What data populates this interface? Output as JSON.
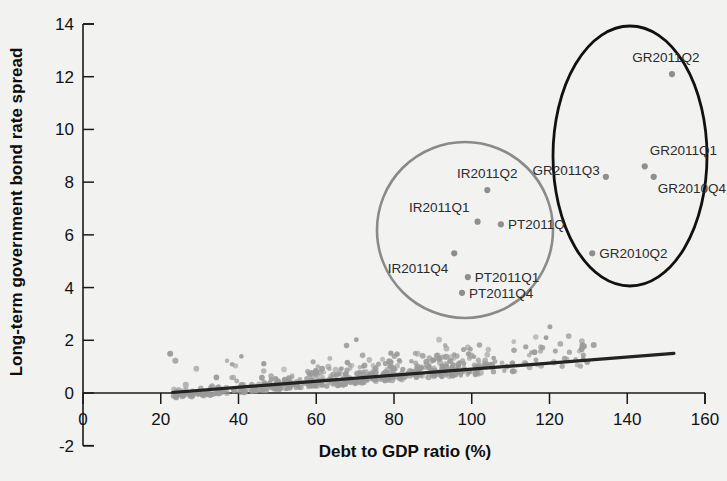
{
  "chart_data": {
    "type": "scatter",
    "title": "",
    "xlabel": "Debt to GDP ratio (%)",
    "ylabel": "Long-term government bond rate spread",
    "xlim": [
      0,
      160
    ],
    "ylim": [
      -2,
      14
    ],
    "xticks": [
      0,
      20,
      40,
      60,
      80,
      100,
      120,
      140,
      160
    ],
    "yticks": [
      -2,
      0,
      2,
      4,
      6,
      8,
      10,
      12,
      14
    ],
    "grid": false,
    "legend": "none",
    "marker_color": "#9a9a9a",
    "trendline_color": "#232323",
    "highlight_circle_left_color": "#8a8a8a",
    "highlight_circle_right_color": "#111111",
    "background_color": "#f2f2f0",
    "trendline": {
      "x_start": 23,
      "y_start": 0.02,
      "x_end": 152,
      "y_end": 1.5,
      "slope": 0.0115,
      "intercept": -0.245
    },
    "labeled_points": [
      {
        "label": "IR2011Q2",
        "x": 104.0,
        "y": 7.7,
        "label_dx": 0,
        "label_dy": -12,
        "anchor": "middle"
      },
      {
        "label": "IR2011Q1",
        "x": 101.5,
        "y": 6.5,
        "label_dx": -8,
        "label_dy": -10,
        "anchor": "end"
      },
      {
        "label": "PT2011Q",
        "x": 107.5,
        "y": 6.4,
        "label_dx": 7,
        "label_dy": 5,
        "anchor": "start"
      },
      {
        "label": "IR2011Q4",
        "x": 95.5,
        "y": 5.3,
        "label_dx": -6,
        "label_dy": 20,
        "anchor": "end"
      },
      {
        "label": "PT2011Q1",
        "x": 99.0,
        "y": 4.4,
        "label_dx": 7,
        "label_dy": 5,
        "anchor": "start"
      },
      {
        "label": "PT2011Q4",
        "x": 97.5,
        "y": 3.8,
        "label_dx": 7,
        "label_dy": 5,
        "anchor": "start"
      },
      {
        "label": "GR2011Q2",
        "x": 151.5,
        "y": 12.1,
        "label_dx": -6,
        "label_dy": -12,
        "anchor": "middle"
      },
      {
        "label": "GR2011Q1",
        "x": 144.5,
        "y": 8.6,
        "label_dx": 5,
        "label_dy": -11,
        "anchor": "start"
      },
      {
        "label": "GR2011Q3",
        "x": 134.5,
        "y": 8.2,
        "label_dx": -6,
        "label_dy": -2,
        "anchor": "end"
      },
      {
        "label": "GR2010Q4",
        "x": 146.8,
        "y": 8.2,
        "label_dx": 4,
        "label_dy": 16,
        "anchor": "start"
      },
      {
        "label": "GR2010Q2",
        "x": 131.0,
        "y": 5.3,
        "label_dx": 7,
        "label_dy": 5,
        "anchor": "start"
      }
    ],
    "highlight_regions": [
      {
        "name": "ireland-portugal-cluster",
        "shape": "circle",
        "cx_px": 465,
        "cy_px": 230,
        "rx_px": 88,
        "ry_px": 88,
        "color": "#8a8a8a"
      },
      {
        "name": "greece-cluster",
        "shape": "ellipse",
        "cx_px": 630,
        "cy_px": 156,
        "rx_px": 77,
        "ry_px": 130,
        "color": "#111111"
      }
    ],
    "scatter_summary": {
      "n_points_approx": 560,
      "x_range_observed": [
        22,
        152
      ],
      "y_range_observed": [
        -0.6,
        3.0
      ],
      "description": "Dense grey cloud of quarterly country observations hugging the zero line, widening upward between 55% and 120% debt-to-GDP."
    }
  },
  "axes": {
    "x_title": "Debt to GDP ratio (%)",
    "y_title": "Long-term government bond rate spread",
    "x_tick_labels": [
      "0",
      "20",
      "40",
      "60",
      "80",
      "100",
      "120",
      "140",
      "160"
    ],
    "y_tick_labels": [
      "-2",
      "0",
      "2",
      "4",
      "6",
      "8",
      "10",
      "12",
      "14"
    ]
  }
}
